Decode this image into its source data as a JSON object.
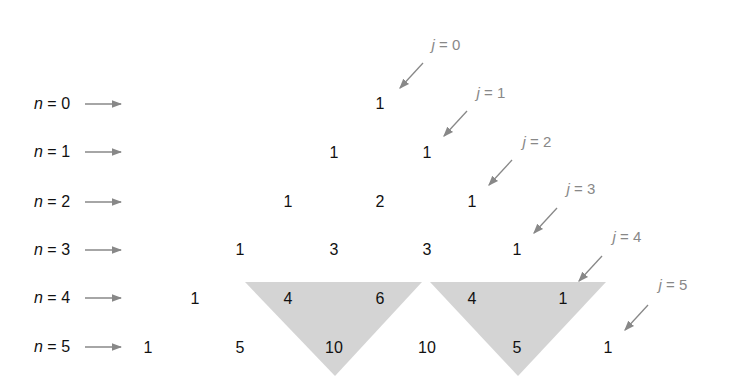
{
  "rows": [
    {
      "n_label": "n = 0",
      "n": "n",
      "eq": " = 0",
      "values": [
        "1"
      ]
    },
    {
      "n_label": "n = 1",
      "n": "n",
      "eq": " = 1",
      "values": [
        "1",
        "1"
      ]
    },
    {
      "n_label": "n = 2",
      "n": "n",
      "eq": " = 2",
      "values": [
        "1",
        "2",
        "1"
      ]
    },
    {
      "n_label": "n = 3",
      "n": "n",
      "eq": " = 3",
      "values": [
        "1",
        "3",
        "3",
        "1"
      ]
    },
    {
      "n_label": "n = 4",
      "n": "n",
      "eq": " = 4",
      "values": [
        "1",
        "4",
        "6",
        "4",
        "1"
      ]
    },
    {
      "n_label": "n = 5",
      "n": "n",
      "eq": " = 5",
      "values": [
        "1",
        "5",
        "10",
        "10",
        "5",
        "1"
      ]
    }
  ],
  "diagonals": [
    {
      "j": "j",
      "eq": " = 0"
    },
    {
      "j": "j",
      "eq": " = 1"
    },
    {
      "j": "j",
      "eq": " = 2"
    },
    {
      "j": "j",
      "eq": " = 3"
    },
    {
      "j": "j",
      "eq": " = 4"
    },
    {
      "j": "j",
      "eq": " = 5"
    }
  ],
  "highlights": [
    {
      "desc": "4 + 6 = 10"
    },
    {
      "desc": "4 + 1 = 5"
    }
  ],
  "colors": {
    "triangle_fill": "#d4d4d4",
    "arrow": "#888888",
    "text": "#111111"
  }
}
